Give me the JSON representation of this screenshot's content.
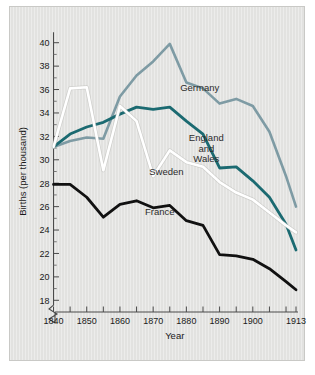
{
  "figure": {
    "background_color": "#e2e2e0",
    "border_color": "#c9c9c6"
  },
  "chart_data": {
    "type": "line",
    "title": "",
    "subtitle": "",
    "xlabel": "Year",
    "ylabel": "Births (per thousand)",
    "xlim": [
      1840,
      1913
    ],
    "ylim": [
      17,
      41
    ],
    "grid": false,
    "legend_position": "inline-labels",
    "y_axis_break": true,
    "y_ticks": [
      18,
      20,
      22,
      24,
      26,
      28,
      30,
      32,
      34,
      36,
      38,
      40
    ],
    "y_tick_labels": [
      "18",
      "20",
      "22",
      "24",
      "26",
      "28",
      "30",
      "32",
      "34",
      "36",
      "38",
      "40"
    ],
    "y_minor_ticks": [
      19,
      21,
      23,
      25,
      27,
      29,
      31,
      33,
      35,
      37,
      39
    ],
    "x_ticks": [
      1840,
      1845,
      1850,
      1855,
      1860,
      1865,
      1870,
      1875,
      1880,
      1885,
      1890,
      1895,
      1900,
      1905,
      1910,
      1913
    ],
    "x_tick_labels": [
      "1840",
      "",
      "1850",
      "",
      "1860",
      "",
      "1870",
      "",
      "1880",
      "",
      "1890",
      "",
      "1900",
      "",
      "",
      "1913"
    ],
    "x_labeled_ticks": [
      {
        "x": 1840,
        "label": "1840"
      },
      {
        "x": 1850,
        "label": "1850"
      },
      {
        "x": 1860,
        "label": "1860"
      },
      {
        "x": 1870,
        "label": "1870"
      },
      {
        "x": 1880,
        "label": "1880"
      },
      {
        "x": 1890,
        "label": "1890"
      },
      {
        "x": 1900,
        "label": "1900"
      },
      {
        "x": 1913,
        "label": "1913"
      }
    ],
    "x": [
      1840,
      1845,
      1850,
      1855,
      1860,
      1865,
      1870,
      1875,
      1880,
      1885,
      1890,
      1895,
      1900,
      1905,
      1910,
      1913
    ],
    "series": [
      {
        "name": "Germany",
        "color": "#7e9ba4",
        "width": 2.6,
        "label": "Germany",
        "label_x": 1884,
        "label_y": 35.9,
        "values": [
          31.1,
          31.6,
          31.9,
          31.8,
          35.4,
          37.2,
          38.4,
          39.9,
          36.6,
          36.1,
          34.8,
          35.2,
          34.6,
          32.4,
          28.6,
          26.0
        ]
      },
      {
        "name": "England and Wales",
        "color": "#1b6a71",
        "width": 2.8,
        "label": "England and Wales",
        "label_lines": [
          "England",
          "and",
          "Wales"
        ],
        "label_x": 1886,
        "label_y": 31.6,
        "values": [
          31.1,
          32.2,
          32.8,
          33.2,
          33.9,
          34.5,
          34.3,
          34.5,
          33.3,
          32.2,
          29.3,
          29.4,
          28.2,
          26.8,
          24.5,
          22.3
        ]
      },
      {
        "name": "Sweden",
        "color": "#ffffff",
        "width": 2.6,
        "label": "Sweden",
        "label_x": 1874,
        "label_y": 28.7,
        "values": [
          31.1,
          36.1,
          36.2,
          29.1,
          34.6,
          33.3,
          28.6,
          30.8,
          29.8,
          29.4,
          28.1,
          27.2,
          26.6,
          25.5,
          24.4,
          23.8
        ]
      },
      {
        "name": "France",
        "color": "#111111",
        "width": 2.8,
        "label": "France",
        "label_x": 1872,
        "label_y": 25.3,
        "values": [
          27.9,
          27.9,
          26.8,
          25.1,
          26.2,
          26.5,
          25.9,
          26.1,
          24.8,
          24.4,
          21.9,
          21.8,
          21.5,
          20.7,
          19.6,
          18.9
        ]
      }
    ]
  }
}
